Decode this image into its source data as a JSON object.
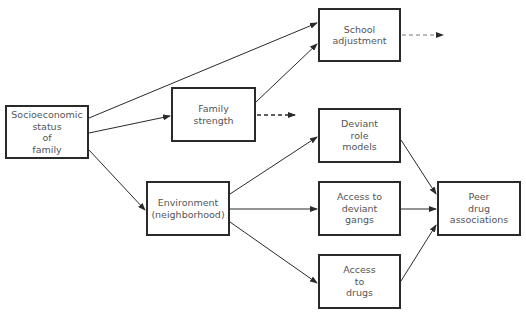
{
  "diagram": {
    "type": "path-diagram",
    "nodes": [
      {
        "id": "ses",
        "lines": [
          "Socioeconomic",
          "status",
          "of",
          "family"
        ],
        "box": [
          5,
          105,
          84,
          54
        ]
      },
      {
        "id": "family_strength",
        "lines": [
          "Family",
          "strength"
        ],
        "box": [
          171,
          87,
          85,
          55
        ]
      },
      {
        "id": "school_adjustment",
        "lines": [
          "School",
          "adjustment"
        ],
        "box": [
          318,
          8,
          83,
          54
        ]
      },
      {
        "id": "environment",
        "lines": [
          "Environment",
          "(neighborhood)"
        ],
        "box": [
          146,
          181,
          84,
          55
        ]
      },
      {
        "id": "deviant_role_models",
        "lines": [
          "Deviant",
          "role",
          "models"
        ],
        "box": [
          318,
          108,
          83,
          55
        ]
      },
      {
        "id": "deviant_gangs",
        "lines": [
          "Access to",
          "deviant",
          "gangs"
        ],
        "box": [
          318,
          181,
          83,
          55
        ]
      },
      {
        "id": "drugs",
        "lines": [
          "Access",
          "to",
          "drugs"
        ],
        "box": [
          318,
          254,
          83,
          55
        ]
      },
      {
        "id": "peer_drug",
        "lines": [
          "Peer",
          "drug",
          "associations"
        ],
        "box": [
          437,
          181,
          84,
          55
        ]
      }
    ],
    "edges": [
      {
        "from": "ses",
        "to": "school_adjustment",
        "style": "solid"
      },
      {
        "from": "ses",
        "to": "family_strength",
        "style": "solid"
      },
      {
        "from": "ses",
        "to": "environment",
        "style": "solid"
      },
      {
        "from": "family_strength",
        "to": "school_adjustment",
        "style": "solid"
      },
      {
        "from": "family_strength",
        "to": "(outgoing)",
        "style": "dashed"
      },
      {
        "from": "school_adjustment",
        "to": "(outgoing)",
        "style": "dashed"
      },
      {
        "from": "environment",
        "to": "deviant_role_models",
        "style": "solid"
      },
      {
        "from": "environment",
        "to": "deviant_gangs",
        "style": "solid"
      },
      {
        "from": "environment",
        "to": "drugs",
        "style": "solid"
      },
      {
        "from": "deviant_role_models",
        "to": "peer_drug",
        "style": "solid"
      },
      {
        "from": "deviant_gangs",
        "to": "peer_drug",
        "style": "solid"
      },
      {
        "from": "drugs",
        "to": "peer_drug",
        "style": "solid"
      }
    ]
  },
  "labels": {
    "ses": [
      "Socioeconomic",
      "status",
      "of",
      "family"
    ],
    "family_strength": [
      "Family",
      "strength"
    ],
    "school_adjustment": [
      "School",
      "adjustment"
    ],
    "environment": [
      "Environment",
      "(neighborhood)"
    ],
    "deviant_role_models": [
      "Deviant",
      "role",
      "models"
    ],
    "deviant_gangs": [
      "Access to",
      "deviant",
      "gangs"
    ],
    "drugs": [
      "Access",
      "to",
      "drugs"
    ],
    "peer_drug": [
      "Peer",
      "drug",
      "associations"
    ]
  },
  "colors": {
    "line": "#2a2a2a",
    "dashed": "#555555",
    "text": "#555555",
    "background": "#ffffff"
  }
}
